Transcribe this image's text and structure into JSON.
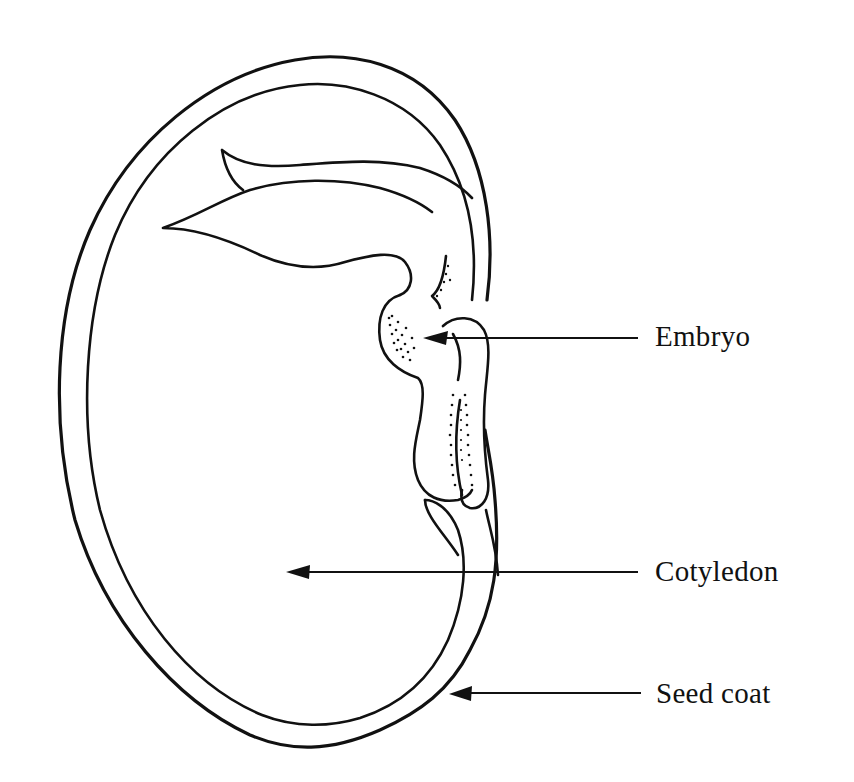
{
  "diagram": {
    "labels": [
      {
        "id": "embryo",
        "text": "Embryo"
      },
      {
        "id": "cotyledon",
        "text": "Cotyledon"
      },
      {
        "id": "seed_coat",
        "text": "Seed coat"
      }
    ],
    "colors": {
      "ink": "#111111",
      "background": "#ffffff"
    }
  }
}
